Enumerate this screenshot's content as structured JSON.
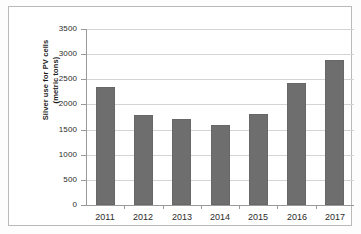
{
  "chart_data": {
    "type": "bar",
    "title": "",
    "xlabel": "",
    "ylabel": "Silver use for PV cells (metric tons)",
    "ylabel_line1": "Silver use for PV cells",
    "ylabel_line2": "(metric tons)",
    "categories": [
      "2011",
      "2012",
      "2013",
      "2014",
      "2015",
      "2016",
      "2017"
    ],
    "values": [
      2350,
      1790,
      1720,
      1590,
      1810,
      2430,
      2890
    ],
    "ylim": [
      0,
      3500
    ],
    "ytick_values": [
      0,
      500,
      1000,
      1500,
      2000,
      2500,
      3000,
      3500
    ],
    "ytick_labels": [
      "0",
      "500",
      "1000",
      "1500",
      "2000",
      "2500",
      "3000",
      "3500"
    ],
    "grid": true,
    "legend": false,
    "legend_position": "none",
    "bar_color": "#6e6e6e",
    "gridline_color": "#d4d4d4",
    "axis_color": "#9a9a9a",
    "frame_color": "#b9b9b9",
    "background_color": "#ffffff"
  }
}
